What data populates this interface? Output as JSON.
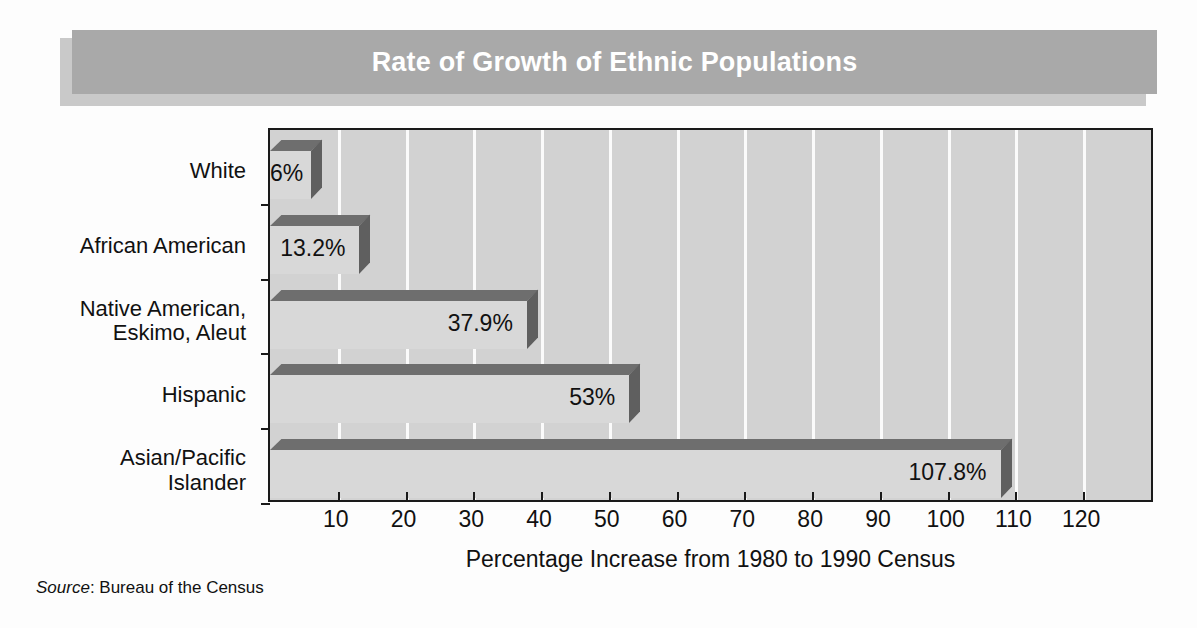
{
  "banner": {
    "title": "Rate of Growth of Ethnic Populations"
  },
  "source": {
    "label": "Source",
    "separator": ": ",
    "text": "Bureau of the Census"
  },
  "colors": {
    "banner_bg": "#a9a9a9",
    "banner_shadow": "#c9c9c9",
    "banner_text": "#ffffff",
    "plot_bg": "#d2d2d2",
    "gridline": "#fbfbfb",
    "bar_front": "#d8d8d8",
    "bar_top": "#6e6e6e",
    "bar_side": "#5f5f5f",
    "axis": "#1a1a1a",
    "text": "#111111",
    "page_bg": "#fdfdfd"
  },
  "chart_data": {
    "type": "bar",
    "orientation": "horizontal",
    "style": "3d",
    "title": "Rate of Growth of Ethnic Populations",
    "xlabel": "Percentage Increase from 1980 to 1990 Census",
    "ylabel": "",
    "xlim": [
      0,
      130
    ],
    "xticks": [
      10,
      20,
      30,
      40,
      50,
      60,
      70,
      80,
      90,
      100,
      110,
      120
    ],
    "xtick_labels": [
      "10",
      "20",
      "30",
      "40",
      "50",
      "60",
      "70",
      "80",
      "90",
      "100",
      "110",
      "120"
    ],
    "grid": "vertical",
    "legend": "none",
    "unit": "%",
    "categories": [
      "White",
      "African American",
      "Native American,\nEskimo, Aleut",
      "Hispanic",
      "Asian/Pacific\nIslander"
    ],
    "values": [
      6,
      13.2,
      37.9,
      53,
      107.8
    ],
    "data_labels": [
      "6%",
      "13.2%",
      "37.9%",
      "53%",
      "107.8%"
    ],
    "bars": [
      {
        "category_line1": "White",
        "category_line2": "",
        "value": 6,
        "label": "6%"
      },
      {
        "category_line1": "African American",
        "category_line2": "",
        "value": 13.2,
        "label": "13.2%"
      },
      {
        "category_line1": "Native American,",
        "category_line2": "Eskimo, Aleut",
        "value": 37.9,
        "label": "37.9%"
      },
      {
        "category_line1": "Hispanic",
        "category_line2": "",
        "value": 53,
        "label": "53%"
      },
      {
        "category_line1": "Asian/Pacific",
        "category_line2": "Islander",
        "value": 107.8,
        "label": "107.8%"
      }
    ]
  }
}
